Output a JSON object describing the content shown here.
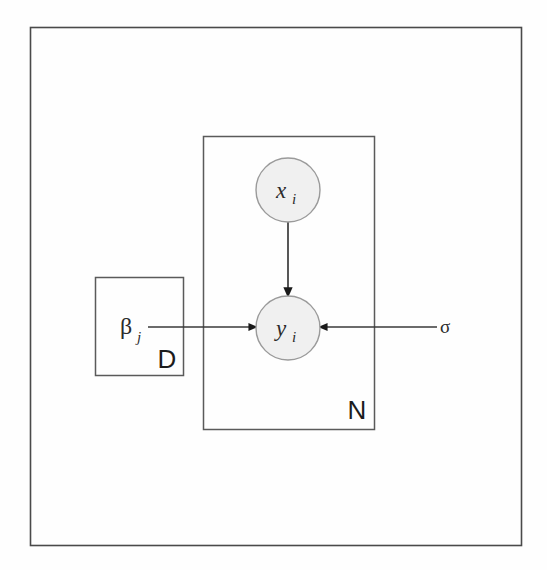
{
  "figure": {
    "type": "plate-diagram",
    "domain": "probabilistic-graphical-model",
    "background_color": "#fefefe",
    "border_color": "#4a4a4a",
    "node_fill_color": "#f0f0f0",
    "node_stroke_color": "#9a9a9a",
    "edge_color": "#3a3a3a"
  },
  "nodes": [
    {
      "id": "x_i",
      "base": "x",
      "subscript": "i",
      "shape": "circle",
      "observed": false,
      "cx": 288,
      "cy": 190,
      "r": 32
    },
    {
      "id": "y_i",
      "base": "y",
      "subscript": "i",
      "shape": "circle",
      "observed": false,
      "cx": 288,
      "cy": 328,
      "r": 32
    }
  ],
  "free_variables": [
    {
      "id": "beta_j",
      "base": "β",
      "subscript": "j",
      "x": 126,
      "y": 330
    },
    {
      "id": "sigma",
      "base": "σ",
      "subscript": "",
      "x": 444,
      "y": 327
    }
  ],
  "plates": [
    {
      "id": "plate-N",
      "label": "N",
      "x": 203,
      "y": 136,
      "width": 171,
      "height": 293,
      "label_x": 357,
      "label_y": 418
    },
    {
      "id": "plate-D",
      "label": "D",
      "x": 95,
      "y": 277,
      "width": 88,
      "height": 98,
      "label_x": 167,
      "label_y": 367
    }
  ],
  "edges": [
    {
      "id": "edge-x-to-y",
      "from": "x_i",
      "to": "y_i",
      "direction": "down",
      "x1": 288,
      "y1": 222,
      "x2": 288,
      "y2": 296
    },
    {
      "id": "edge-beta-to-y",
      "from": "beta_j",
      "to": "y_i",
      "direction": "right",
      "x1": 148,
      "y1": 327,
      "x2": 256,
      "y2": 327
    },
    {
      "id": "edge-sigma-to-y",
      "from": "sigma",
      "to": "y_i",
      "direction": "left",
      "x1": 437,
      "y1": 327,
      "x2": 320,
      "y2": 327
    }
  ],
  "outer_frame": {
    "id": "outer-frame",
    "x": 30,
    "y": 27,
    "width": 491,
    "height": 518
  }
}
